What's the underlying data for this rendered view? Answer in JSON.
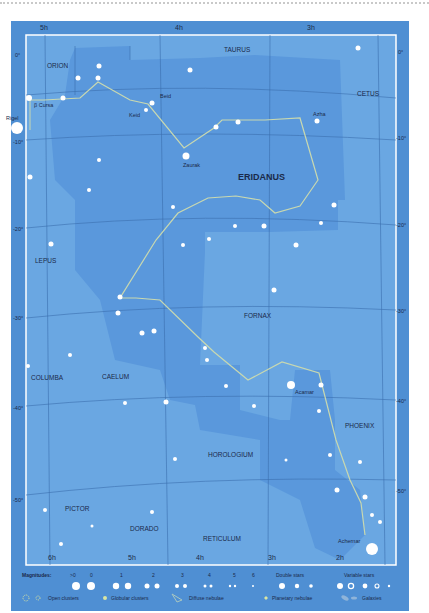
{
  "map": {
    "title": "ERIDANUS",
    "ra_labels_top": [
      "5h",
      "4h",
      "3h"
    ],
    "ra_labels_bottom": [
      "6h",
      "5h",
      "4h",
      "3h",
      "2h"
    ],
    "dec_labels_left": [
      "0°",
      "-10°",
      "-20°",
      "-30°",
      "-40°",
      "-50°"
    ],
    "dec_labels_right": [
      "0°",
      "-10°",
      "-20°",
      "-30°",
      "-40°",
      "-50°"
    ],
    "constellations": [
      "ORION",
      "TAURUS",
      "CETUS",
      "ERIDANUS",
      "LEPUS",
      "FORNAX",
      "COLUMBA",
      "CAELUM",
      "HOROLOGIUM",
      "PHOENIX",
      "PICTOR",
      "DORADO",
      "RETICULUM"
    ],
    "star_names": [
      "Rigel",
      "β Cursa",
      "Beid",
      "Keid",
      "Zaurak",
      "Azha",
      "Acamar",
      "Achernar"
    ],
    "catalog_labels": [
      "69",
      "66",
      "62",
      "51",
      "45",
      "35",
      "32",
      "30",
      "25",
      "24",
      "22",
      "21",
      "17",
      "46",
      "47",
      "56",
      "55",
      "37",
      "39",
      "63",
      "64",
      "53",
      "60",
      "59",
      "58",
      "54",
      "20",
      "15",
      "6",
      "4",
      "41",
      "42",
      "82",
      "1535",
      "1300",
      "1291"
    ],
    "greek_labels": [
      "β",
      "μ",
      "ν",
      "ω",
      "ψ",
      "λ",
      "ξ",
      "ο¹",
      "ο²",
      "γ",
      "π",
      "δ",
      "ε",
      "ζ",
      "ρ¹˒²˒³",
      "η",
      "τ¹",
      "τ²",
      "τ³",
      "τ⁴",
      "τ⁵",
      "τ⁶",
      "τ⁷",
      "τ⁸",
      "τ⁹",
      "υ¹",
      "υ²",
      "θ",
      "ι",
      "s",
      "κ",
      "φ",
      "χ",
      "g",
      "h",
      "i",
      "y",
      "e",
      "f",
      "p",
      "q¹",
      "q²",
      "α"
    ]
  },
  "legend": {
    "magnitudes_label": "Magnitudes:",
    "magnitudes": [
      ">0",
      "0",
      "1",
      "2",
      "3",
      "4",
      "5",
      "6"
    ],
    "double_stars": "Double stars",
    "variable_stars": "Variable stars",
    "open_clusters": "Open clusters",
    "globular_clusters": "Globular clusters",
    "diffuse_nebulae": "Diffuse nebulae",
    "planetary_nebulae": "Planetary nebulae",
    "galaxies": "Galaxies"
  },
  "colors": {
    "outer": "#4f8fd3",
    "sky": "#6aa7e2",
    "eridanus": "#5a98dc",
    "line": "#c8d8b0",
    "text": "#1a2a4a"
  }
}
